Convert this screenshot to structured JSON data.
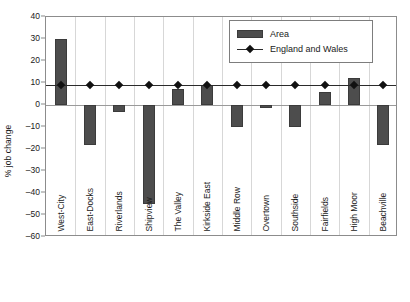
{
  "chart_data": {
    "type": "bar",
    "title": "",
    "xlabel": "",
    "ylabel": "% job change",
    "ylim": [
      -60,
      40
    ],
    "ytick_step": 10,
    "yticks": [
      40,
      30,
      20,
      10,
      0,
      -10,
      -20,
      -30,
      -40,
      -50,
      -60
    ],
    "ytick_labels": [
      "40",
      "30",
      "20",
      "10",
      "0",
      "-10",
      "-20",
      "-30",
      "-40",
      "-50",
      "-60"
    ],
    "grid": false,
    "legend_position": "top-right",
    "categories": [
      "West-City",
      "East-Docks",
      "Riverlands",
      "Shipview",
      "The Valley",
      "Kirkside East",
      "Middle Row",
      "Overtown",
      "Southside",
      "Fairfields",
      "High Moor",
      "Beachville"
    ],
    "series": [
      {
        "name": "Area",
        "type": "bar",
        "color": "#4d4d4d",
        "values": [
          30,
          -18,
          -3,
          -45,
          7.5,
          9,
          -10,
          -1.5,
          -10,
          6,
          12.5,
          -18
        ]
      },
      {
        "name": "England and Wales",
        "type": "line",
        "color": "#2b2b2b",
        "marker": "diamond",
        "values": [
          9,
          9,
          9,
          9,
          9,
          9,
          9,
          9,
          9,
          9,
          9,
          9
        ]
      }
    ]
  },
  "legend": {
    "entries": [
      {
        "label": "Area"
      },
      {
        "label": "England and Wales"
      }
    ]
  },
  "axis": {
    "y_title": "% job change"
  }
}
